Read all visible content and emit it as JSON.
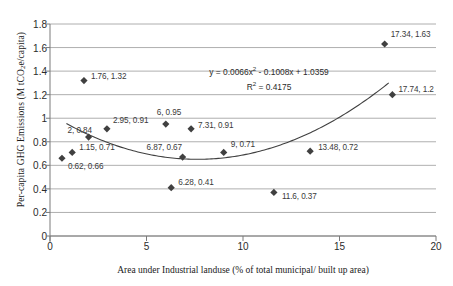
{
  "chart_data": {
    "type": "scatter",
    "title": "",
    "xlabel": "Area under Industrial landuse (% of total municipal/ built up area)",
    "ylabel": "Per-capita GHG Emissions (M tCO2e/capita)",
    "xlim": [
      0,
      20
    ],
    "ylim": [
      0,
      1.8
    ],
    "xticks": [
      "0",
      "5",
      "10",
      "15",
      "20"
    ],
    "yticks": [
      "0",
      "0.2",
      "0.4",
      "0.6",
      "0.8",
      "1",
      "1.2",
      "1.4",
      "1.6",
      "1.8"
    ],
    "grid": "horizontal",
    "legend": "none",
    "marker": "diamond",
    "marker_color": "#404040",
    "trendline": {
      "type": "polynomial",
      "order": 2,
      "coefficients": [
        0.0066,
        -0.1008,
        1.0359
      ],
      "equation": "y = 0.0066x",
      "equation_exp": "2",
      "equation_rest": " - 0.1008x + 1.0359",
      "r2_label": "R",
      "r2_exp": "2",
      "r2_value": " = 0.4175",
      "x_start": 0.85,
      "x_end": 17.55,
      "color": "#404040"
    },
    "points": [
      {
        "x": 0.62,
        "y": 0.66,
        "label": "0.62, 0.66",
        "label_dx": 6,
        "label_dy": 9
      },
      {
        "x": 1.15,
        "y": 0.71,
        "label": "1.15, 0.71",
        "label_dx": 7,
        "label_dy": -4
      },
      {
        "x": 1.76,
        "y": 1.32,
        "label": "1.76, 1.32",
        "label_dx": 7,
        "label_dy": -4
      },
      {
        "x": 2.0,
        "y": 0.84,
        "label": "2, 0.84",
        "label_dx": -21,
        "label_dy": -6
      },
      {
        "x": 2.95,
        "y": 0.91,
        "label": "2.95, 0.91",
        "label_dx": 6,
        "label_dy": -8
      },
      {
        "x": 6.0,
        "y": 0.95,
        "label": "6, 0.95",
        "label_dx": -9,
        "label_dy": -11
      },
      {
        "x": 6.28,
        "y": 0.41,
        "label": "6.28, 0.41",
        "label_dx": 7,
        "label_dy": -5
      },
      {
        "x": 6.87,
        "y": 0.67,
        "label": "6.87, 0.67",
        "label_dx": -36,
        "label_dy": -9
      },
      {
        "x": 7.31,
        "y": 0.91,
        "label": "7.31, 0.91",
        "label_dx": 7,
        "label_dy": -3
      },
      {
        "x": 9.0,
        "y": 0.71,
        "label": "9, 0.71",
        "label_dx": 7,
        "label_dy": -7
      },
      {
        "x": 11.6,
        "y": 0.37,
        "label": "11.6, 0.37",
        "label_dx": 8,
        "label_dy": 5
      },
      {
        "x": 13.48,
        "y": 0.72,
        "label": "13.48, 0.72",
        "label_dx": 8,
        "label_dy": -3
      },
      {
        "x": 17.34,
        "y": 1.63,
        "label": "17.34, 1.63",
        "label_dx": 6,
        "label_dy": -9
      },
      {
        "x": 17.74,
        "y": 1.2,
        "label": "17.74, 1.2",
        "label_dx": 6,
        "label_dy": -5
      }
    ]
  },
  "axis": {
    "y_title_pre": "Per-capita GHG Emissions (M tCO",
    "y_title_sub": "2",
    "y_title_post": "e/capita)",
    "x_title": "Area under Industrial landuse (% of total municipal/ built up area)"
  }
}
